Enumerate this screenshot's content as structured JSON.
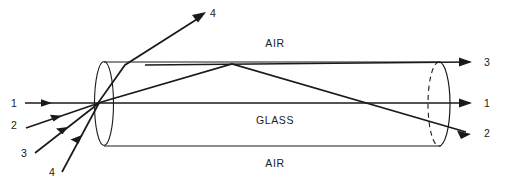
{
  "figure": {
    "background_color": "#ffffff",
    "line_color": "#1a1a1a",
    "text_color": "#1a1a1a"
  },
  "media_labels": [
    {
      "name": "air-top",
      "text": "AIR",
      "x": 275,
      "y": 47
    },
    {
      "name": "glass-middle",
      "text": "GLASS",
      "x": 275,
      "y": 124
    },
    {
      "name": "air-bottom",
      "text": "AIR",
      "x": 275,
      "y": 167
    }
  ],
  "cylinder": {
    "left_face": {
      "cx": 104,
      "cy": 103.5,
      "rx": 9.5,
      "ry": 42,
      "style": "solid"
    },
    "right_face": {
      "cx": 439,
      "cy": 104,
      "rx": 11,
      "ry": 42,
      "front_style": "solid",
      "back_style": "dashed"
    },
    "top_wall_y": 62,
    "bottom_wall_y": 146,
    "wall_x_start": 104,
    "wall_x_end": 439,
    "axis_y": 103
  },
  "entry_point": {
    "x": 98,
    "y": 103
  },
  "reflection_point": {
    "x": 232,
    "y": 64
  },
  "incoming_rays": [
    {
      "id": "1",
      "label": "1",
      "label_x": 14,
      "label_y": 106,
      "from_x": 25,
      "from_y": 103,
      "to_x": 98,
      "to_y": 103,
      "arrow_at_x": 51,
      "arrow_at_y": 103
    },
    {
      "id": "2",
      "label": "2",
      "label_x": 14,
      "label_y": 128,
      "from_x": 26,
      "from_y": 128,
      "to_x": 98,
      "to_y": 103,
      "arrow_at_x": 60,
      "arrow_at_y": 116
    },
    {
      "id": "3",
      "label": "3",
      "label_x": 24,
      "label_y": 156,
      "from_x": 35,
      "from_y": 153,
      "to_x": 98,
      "to_y": 103,
      "arrow_at_x": 66,
      "arrow_at_y": 128
    },
    {
      "id": "4",
      "label": "4",
      "label_x": 52,
      "label_y": 175,
      "from_x": 62,
      "from_y": 172,
      "to_x": 98,
      "to_y": 103,
      "arrow_at_x": 81,
      "arrow_at_y": 137
    }
  ],
  "outgoing_rays": [
    {
      "id": "1",
      "label": "1",
      "label_x": 489,
      "label_y": 106,
      "path": "98,103 470,103",
      "arrow_x": 470,
      "arrow_y": 103,
      "arrow_angle": 0
    },
    {
      "id": "3",
      "label": "3",
      "label_x": 489,
      "label_y": 65,
      "path": "145,65 470,62",
      "arrow_x": 470,
      "arrow_y": 62,
      "arrow_angle": 0
    },
    {
      "id": "2",
      "label": "2",
      "label_x": 489,
      "label_y": 136,
      "path": "98,103 232,64 470,133",
      "arrow_x": 470,
      "arrow_y": 133,
      "arrow_angle": 16
    },
    {
      "id": "4",
      "label": "4",
      "label_x": 213,
      "label_y": 16,
      "path": "98,103 125,65 205,13",
      "arrow_x": 205,
      "arrow_y": 13,
      "arrow_angle": -33
    }
  ]
}
